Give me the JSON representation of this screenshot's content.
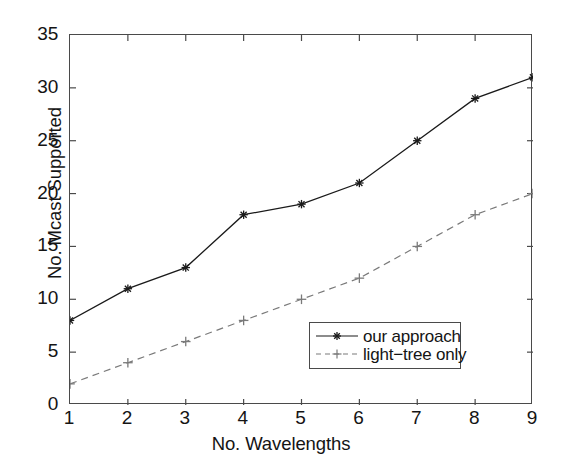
{
  "chart_data": {
    "type": "line",
    "title": "",
    "xlabel": "No. Wavelengths",
    "ylabel": "No. Mcast Supported",
    "x": [
      1,
      2,
      3,
      4,
      5,
      6,
      7,
      8,
      9
    ],
    "xlim": [
      1,
      9
    ],
    "ylim": [
      0,
      35
    ],
    "xticks": [
      "1",
      "2",
      "3",
      "4",
      "5",
      "6",
      "7",
      "8",
      "9"
    ],
    "yticks": [
      "0",
      "5",
      "10",
      "15",
      "20",
      "25",
      "30",
      "35"
    ],
    "grid": false,
    "legend_position": "lower right",
    "series": [
      {
        "name": "our approach",
        "values": [
          8,
          11,
          13,
          18,
          19,
          21,
          25,
          29,
          31
        ],
        "line_style": "solid",
        "marker": "star",
        "color": "#1a1a1a"
      },
      {
        "name": "light−tree only",
        "values": [
          2,
          4,
          6,
          8,
          10,
          12,
          15,
          18,
          20
        ],
        "line_style": "dashed",
        "marker": "plus",
        "color": "#7a7a7a"
      }
    ]
  },
  "legend": {
    "items": [
      {
        "label": "our approach"
      },
      {
        "label": "light−tree only"
      }
    ]
  },
  "axes": {
    "frame_color": "#4a4a4a"
  }
}
